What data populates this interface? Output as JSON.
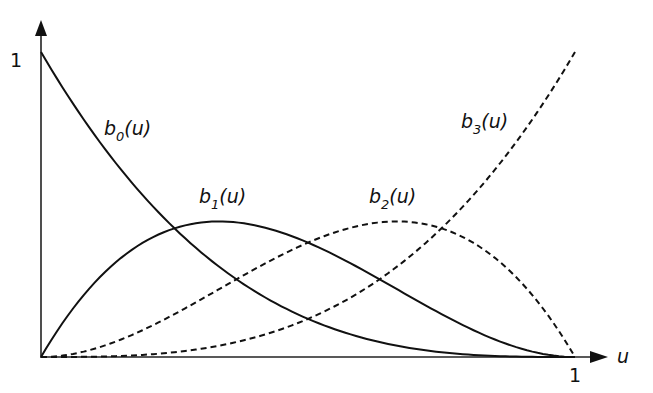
{
  "chart_data": {
    "type": "line",
    "title": "",
    "xlabel": "u",
    "ylabel": "",
    "xlim": [
      0,
      1
    ],
    "ylim": [
      0,
      1
    ],
    "grid": false,
    "legend": "inline labels on curves",
    "x_ticks": [
      "1"
    ],
    "y_ticks": [
      "1"
    ],
    "x": [
      0,
      0.1,
      0.2,
      0.3,
      0.4,
      0.5,
      0.6,
      0.7,
      0.8,
      0.9,
      1.0
    ],
    "series": [
      {
        "name": "b0(u)",
        "label_base": "b",
        "label_sub": "0",
        "label_arg": "(u)",
        "style": "solid",
        "values": [
          1.0,
          0.729,
          0.512,
          0.343,
          0.216,
          0.125,
          0.064,
          0.027,
          0.008,
          0.001,
          0.0
        ]
      },
      {
        "name": "b1(u)",
        "label_base": "b",
        "label_sub": "1",
        "label_arg": "(u)",
        "style": "solid",
        "values": [
          0.0,
          0.243,
          0.384,
          0.441,
          0.432,
          0.375,
          0.288,
          0.189,
          0.096,
          0.027,
          0.0
        ]
      },
      {
        "name": "b2(u)",
        "label_base": "b",
        "label_sub": "2",
        "label_arg": "(u)",
        "style": "dashed",
        "values": [
          0.0,
          0.027,
          0.096,
          0.189,
          0.288,
          0.375,
          0.432,
          0.441,
          0.384,
          0.243,
          0.0
        ]
      },
      {
        "name": "b3(u)",
        "label_base": "b",
        "label_sub": "3",
        "label_arg": "(u)",
        "style": "dashed",
        "values": [
          0.0,
          0.001,
          0.008,
          0.027,
          0.064,
          0.125,
          0.216,
          0.343,
          0.512,
          0.729,
          1.0
        ]
      }
    ],
    "colors": {
      "line": "#111111",
      "axis": "#222222",
      "background": "#ffffff"
    }
  }
}
